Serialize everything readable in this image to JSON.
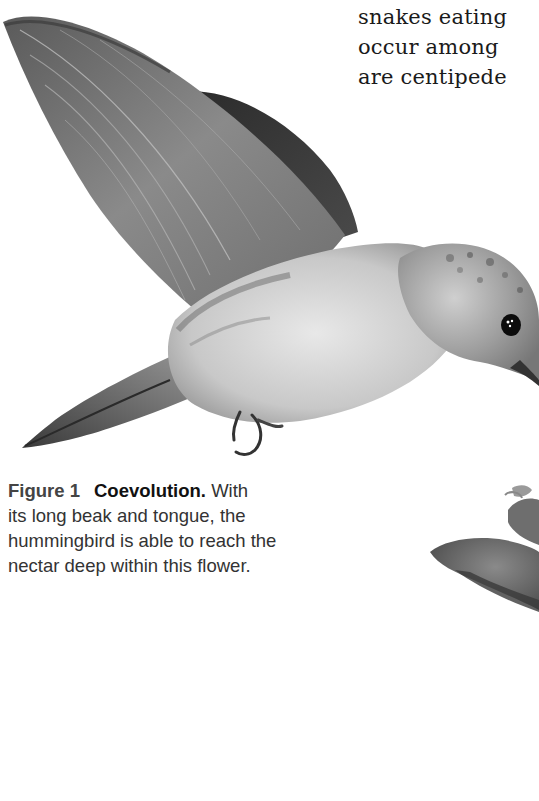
{
  "page": {
    "body_text": {
      "lines": [
        "snakes eating",
        "occur among",
        "are centipede"
      ]
    },
    "figure": {
      "subject": "hummingbird-feeding-at-flower",
      "caption": {
        "label": "Figure 1",
        "title": "Coevolution.",
        "first_line_rest": "With",
        "lines": [
          "its long beak and tongue, the",
          "hummingbird is able to reach the",
          "nectar deep within this flower."
        ]
      }
    },
    "colors": {
      "background": "#ffffff",
      "body_text": "#1a1a1a",
      "caption_label": "#444444",
      "caption_text": "#333333"
    }
  }
}
